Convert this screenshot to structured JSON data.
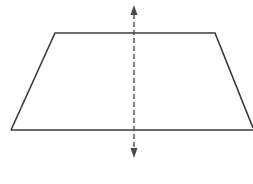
{
  "diagram": {
    "shape": "trapezoid",
    "stroke_color": "#3a3a3a",
    "axis_color": "#4a4a4a",
    "background": "#ffffff",
    "vertices": {
      "top_left": [
        55,
        33
      ],
      "top_right": [
        215,
        33
      ],
      "bottom_right": [
        253,
        130
      ],
      "bottom_left": [
        11,
        130
      ]
    },
    "symmetry_line": {
      "style": "dashed",
      "x": 134,
      "y_start": 5,
      "y_end": 158,
      "arrowheads": "both"
    }
  }
}
